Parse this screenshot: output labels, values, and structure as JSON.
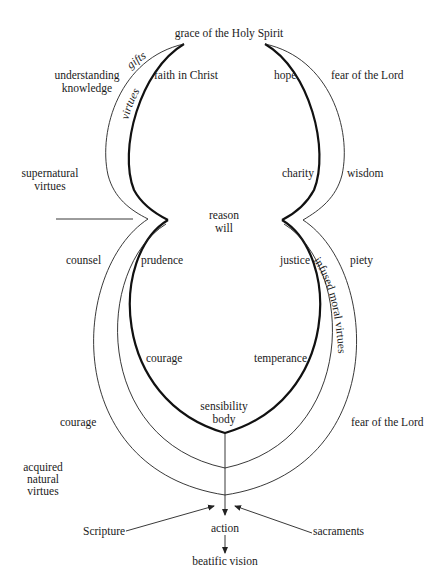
{
  "diagram": {
    "top": {
      "grace": "grace of the Holy Spirit"
    },
    "arc_labels": {
      "gifts": "gifts",
      "virtues": "virtues",
      "infused_moral_virtues": "infused moral virtues"
    },
    "upper_left": {
      "gifts_label_line1": "understanding",
      "gifts_label_line2": "knowledge",
      "theological_virtue": "faith in Christ"
    },
    "upper_right": {
      "theological_virtue_hope": "hope",
      "gift_fear": "fear of the Lord",
      "theological_virtue_charity": "charity",
      "gift_wisdom": "wisdom"
    },
    "left_category": {
      "line1": "supernatural",
      "line2": "virtues"
    },
    "center": {
      "reason": "reason",
      "will": "will",
      "sensibility": "sensibility",
      "body": "body"
    },
    "lower_left": {
      "gift_counsel": "counsel",
      "cardinal_prudence": "prudence",
      "cardinal_courage": "courage",
      "acquired_courage": "courage",
      "acquired_line1": "acquired",
      "acquired_line2": "natural",
      "acquired_line3": "virtues"
    },
    "lower_right": {
      "cardinal_justice": "justice",
      "gift_piety": "piety",
      "cardinal_temperance": "temperance",
      "gift_fear_lower": "fear of the Lord"
    },
    "bottom": {
      "scripture": "Scripture",
      "sacraments": "sacraments",
      "action": "action",
      "beatific_vision": "beatific vision"
    }
  }
}
